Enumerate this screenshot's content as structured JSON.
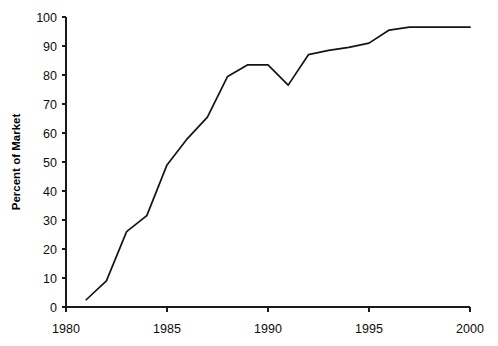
{
  "chart_data": {
    "type": "line",
    "title": "",
    "xlabel": "",
    "ylabel": "Percent of Market",
    "xlim": [
      1980,
      2000
    ],
    "ylim": [
      0,
      100
    ],
    "grid": false,
    "legend": "none",
    "x_ticks": [
      1980,
      1985,
      1990,
      1995,
      2000
    ],
    "x_tick_labels": [
      "1980",
      "1985",
      "1990",
      "1995",
      "2000"
    ],
    "y_ticks": [
      0,
      10,
      20,
      30,
      40,
      50,
      60,
      70,
      80,
      90,
      100
    ],
    "y_tick_labels": [
      "0",
      "10",
      "20",
      "30",
      "40",
      "50",
      "60",
      "70",
      "80",
      "90",
      "100"
    ],
    "series": [
      {
        "name": "Percent of Market",
        "color": "#141414",
        "x": [
          1981,
          1982,
          1983,
          1984,
          1985,
          1986,
          1987,
          1988,
          1989,
          1990,
          1991,
          1992,
          1993,
          1994,
          1995,
          1996,
          1997,
          1998,
          1999,
          2000
        ],
        "values": [
          2.5,
          9,
          26,
          31.5,
          49,
          58,
          65.5,
          79.5,
          83.5,
          83.5,
          76.5,
          87,
          88.5,
          89.5,
          91,
          95.5,
          96.5,
          96.5,
          96.5,
          96.5
        ]
      }
    ]
  },
  "axis": {
    "y_title": "Percent of Market"
  }
}
